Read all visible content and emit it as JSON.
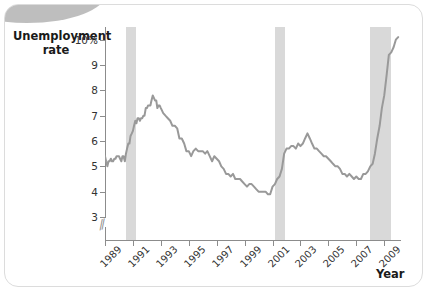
{
  "chart_data": {
    "type": "line",
    "title": "",
    "xlabel": "Year",
    "ylabel": "Unemployment rate",
    "ylim": [
      3,
      10.5
    ],
    "xlim": [
      1989,
      2010.2
    ],
    "grid": false,
    "legend": "none",
    "y_ticks": [
      "3",
      "4",
      "5",
      "6",
      "7",
      "8",
      "9",
      "10%"
    ],
    "y_tick_values": [
      3,
      4,
      5,
      6,
      7,
      8,
      9,
      10
    ],
    "axis_break_below": 3,
    "x_ticks": [
      "1989",
      "1991",
      "1993",
      "1995",
      "1997",
      "1999",
      "2001",
      "2003",
      "2005",
      "2007",
      "2009"
    ],
    "x_tick_values": [
      1989,
      1991,
      1993,
      1995,
      1997,
      1999,
      2001,
      2003,
      2005,
      2007,
      2009
    ],
    "line_color": "#999999",
    "band_color": "#d9d9d9",
    "shaded_regions": [
      {
        "name": "recession-1990-1991",
        "start": 1990.5,
        "end": 1991.25
      },
      {
        "name": "recession-2001",
        "start": 2001.2,
        "end": 2001.92
      },
      {
        "name": "recession-2007-2009",
        "start": 2007.95,
        "end": 2009.5
      }
    ],
    "series": [
      {
        "name": "Unemployment rate",
        "x": [
          1989.0,
          1989.08,
          1989.17,
          1989.25,
          1989.33,
          1989.42,
          1989.5,
          1989.58,
          1989.67,
          1989.75,
          1989.83,
          1989.92,
          1990.0,
          1990.08,
          1990.17,
          1990.25,
          1990.33,
          1990.42,
          1990.5,
          1990.58,
          1990.67,
          1990.75,
          1990.83,
          1990.92,
          1991.0,
          1991.08,
          1991.17,
          1991.25,
          1991.33,
          1991.42,
          1991.5,
          1991.58,
          1991.67,
          1991.75,
          1991.83,
          1991.92,
          1992.0,
          1992.08,
          1992.17,
          1992.25,
          1992.33,
          1992.42,
          1992.5,
          1992.58,
          1992.67,
          1992.75,
          1992.83,
          1992.92,
          1993.0,
          1993.17,
          1993.33,
          1993.5,
          1993.67,
          1993.83,
          1994.0,
          1994.17,
          1994.33,
          1994.5,
          1994.67,
          1994.83,
          1995.0,
          1995.17,
          1995.33,
          1995.5,
          1995.67,
          1995.83,
          1996.0,
          1996.17,
          1996.33,
          1996.5,
          1996.67,
          1996.83,
          1997.0,
          1997.17,
          1997.33,
          1997.5,
          1997.67,
          1997.83,
          1998.0,
          1998.17,
          1998.33,
          1998.5,
          1998.67,
          1998.83,
          1999.0,
          1999.17,
          1999.33,
          1999.5,
          1999.67,
          1999.83,
          2000.0,
          2000.17,
          2000.33,
          2000.5,
          2000.67,
          2000.83,
          2001.0,
          2001.17,
          2001.33,
          2001.5,
          2001.67,
          2001.83,
          2002.0,
          2002.17,
          2002.33,
          2002.5,
          2002.67,
          2002.83,
          2003.0,
          2003.17,
          2003.33,
          2003.5,
          2003.67,
          2003.83,
          2004.0,
          2004.17,
          2004.33,
          2004.5,
          2004.67,
          2004.83,
          2005.0,
          2005.17,
          2005.33,
          2005.5,
          2005.67,
          2005.83,
          2006.0,
          2006.17,
          2006.33,
          2006.5,
          2006.67,
          2006.83,
          2007.0,
          2007.17,
          2007.33,
          2007.5,
          2007.67,
          2007.83,
          2008.0,
          2008.17,
          2008.33,
          2008.5,
          2008.67,
          2008.83,
          2009.0,
          2009.17,
          2009.33,
          2009.5,
          2009.67,
          2009.83,
          2010.0
        ],
        "values": [
          5.4,
          5.2,
          5.0,
          5.2,
          5.2,
          5.3,
          5.2,
          5.2,
          5.3,
          5.3,
          5.4,
          5.4,
          5.4,
          5.3,
          5.2,
          5.4,
          5.4,
          5.2,
          5.5,
          5.7,
          5.9,
          5.9,
          6.2,
          6.3,
          6.4,
          6.6,
          6.8,
          6.7,
          6.9,
          6.9,
          6.8,
          6.9,
          6.9,
          7.0,
          7.0,
          7.3,
          7.3,
          7.4,
          7.4,
          7.4,
          7.6,
          7.8,
          7.7,
          7.6,
          7.6,
          7.3,
          7.4,
          7.4,
          7.3,
          7.1,
          7.0,
          6.9,
          6.8,
          6.6,
          6.6,
          6.5,
          6.1,
          6.1,
          5.9,
          5.6,
          5.6,
          5.4,
          5.6,
          5.7,
          5.6,
          5.6,
          5.6,
          5.5,
          5.6,
          5.4,
          5.2,
          5.4,
          5.3,
          5.2,
          5.0,
          4.9,
          4.7,
          4.7,
          4.6,
          4.7,
          4.5,
          4.5,
          4.5,
          4.4,
          4.3,
          4.2,
          4.3,
          4.3,
          4.2,
          4.1,
          4.0,
          4.0,
          4.0,
          4.0,
          3.9,
          3.9,
          4.2,
          4.3,
          4.5,
          4.6,
          4.9,
          5.5,
          5.7,
          5.7,
          5.8,
          5.8,
          5.7,
          5.9,
          5.8,
          5.9,
          6.1,
          6.3,
          6.1,
          5.9,
          5.7,
          5.7,
          5.6,
          5.5,
          5.4,
          5.4,
          5.3,
          5.2,
          5.1,
          5.0,
          5.0,
          4.9,
          4.7,
          4.7,
          4.6,
          4.7,
          4.6,
          4.5,
          4.6,
          4.5,
          4.5,
          4.7,
          4.7,
          4.8,
          5.0,
          5.1,
          5.5,
          6.1,
          6.6,
          7.3,
          7.8,
          8.6,
          9.4,
          9.5,
          9.7,
          10.0,
          10.1
        ]
      }
    ]
  },
  "labels": {
    "y_axis_title_line1": "Unemployment",
    "y_axis_title_line2": "rate",
    "x_axis_title": "Year",
    "axis_break_symbol": "//"
  }
}
